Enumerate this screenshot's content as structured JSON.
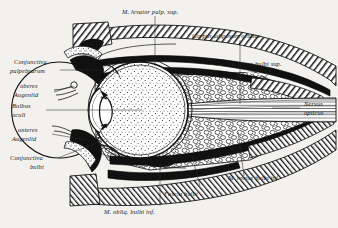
{
  "figure": {
    "background_color": "#f2f1ee",
    "ink_color": "#141414",
    "width": 338,
    "height": 228
  },
  "labels": {
    "levator": "M. levator palp. sup.",
    "corpus_adiposum": "Corpus adiposum orbitae",
    "rectus_sup": "M. rectus bulbi sup.",
    "nervus_opticus_1": "Nervus",
    "nervus_opticus_2": "opticus",
    "rectus_inf": "M. rectus bulbi inf.",
    "fascia_bulbi": "Fascia bulbi",
    "obliq_inf": "M. obliq. bulbi inf.",
    "conjunctiva_palp_1": "Conjunctiva",
    "conjunctiva_palp_2": "palpebrarum",
    "oberes_1": "oberes",
    "oberes_2": "Augenlid",
    "bulbus_1": "Bulbus",
    "bulbus_2": "oculi",
    "unteres_1": "unteres",
    "unteres_2": "Augenlid",
    "conjunctiva_bulbi_1": "Conjunctiva",
    "conjunctiva_bulbi_2": "bulbi"
  },
  "structures": [
    {
      "name": "eyeball-globe",
      "texture": "stipple"
    },
    {
      "name": "lens",
      "texture": "solid-white"
    },
    {
      "name": "cornea",
      "texture": "outline"
    },
    {
      "name": "orbital-fat-body",
      "texture": "cobblestone"
    },
    {
      "name": "orbital-bone",
      "texture": "diagonal-hatch"
    },
    {
      "name": "extraocular-muscle",
      "texture": "solid-black"
    },
    {
      "name": "optic-nerve",
      "texture": "longitudinal-stripe"
    },
    {
      "name": "eyelid-upper",
      "texture": "solid-black"
    },
    {
      "name": "eyelid-lower",
      "texture": "solid-black"
    }
  ]
}
